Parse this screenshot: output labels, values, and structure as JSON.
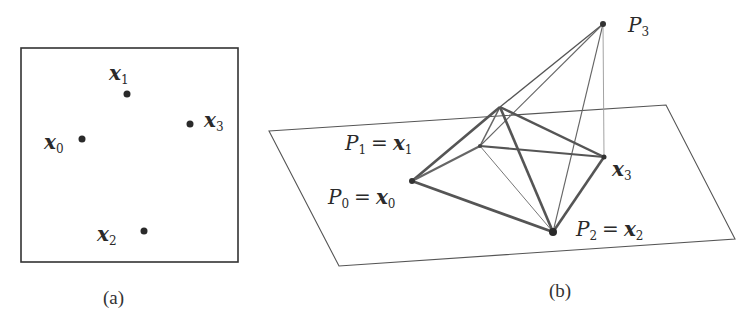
{
  "panel_a": {
    "caption": "(a)",
    "box": {
      "x": 21,
      "y": 48,
      "w": 217,
      "h": 214
    },
    "points": [
      {
        "id": "x0",
        "var": "x",
        "sub": "0",
        "cx": 82,
        "cy": 139,
        "lx": 44,
        "ly": 148
      },
      {
        "id": "x1",
        "var": "x",
        "sub": "1",
        "cx": 127,
        "cy": 94,
        "lx": 109,
        "ly": 78
      },
      {
        "id": "x2",
        "var": "x",
        "sub": "2",
        "cx": 144,
        "cy": 231,
        "lx": 97,
        "ly": 240
      },
      {
        "id": "x3",
        "var": "x",
        "sub": "3",
        "cx": 190,
        "cy": 124,
        "lx": 204,
        "ly": 126
      }
    ]
  },
  "panel_b": {
    "caption": "(b)",
    "plane": {
      "points": "269,131 666,105 735,239 339,266"
    },
    "vertices": {
      "P0": {
        "x": 412,
        "y": 181
      },
      "P1": {
        "x": 480,
        "y": 146
      },
      "P2": {
        "x": 553,
        "y": 232
      },
      "P3": {
        "x": 603,
        "y": 24
      },
      "x3": {
        "x": 604,
        "y": 157
      },
      "Q": {
        "x": 500,
        "y": 107
      }
    },
    "labels": {
      "P3": {
        "text": "P",
        "sub": "3",
        "x": 628,
        "y": 32
      },
      "P1": {
        "text": "P",
        "sub": "1",
        "rhs": "x",
        "rhs_sub": "1",
        "x": 345,
        "y": 148
      },
      "P0": {
        "text": "P",
        "sub": "0",
        "rhs": "x",
        "rhs_sub": "0",
        "x": 328,
        "y": 204
      },
      "P2": {
        "text": "P",
        "sub": "2",
        "rhs": "x",
        "rhs_sub": "2",
        "x": 576,
        "y": 235
      },
      "x3": {
        "text": "x",
        "sub": "3",
        "x": 612,
        "y": 176
      }
    },
    "equals": "="
  },
  "captions": {
    "a": "(a)",
    "b": "(b)"
  }
}
